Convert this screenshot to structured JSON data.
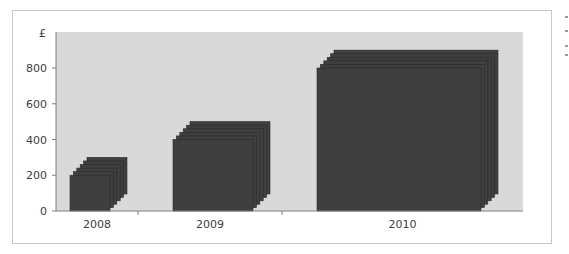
{
  "chart_data": {
    "type": "bar",
    "style": "stacked-depth 3D blocks (front face = lower value, back face = upper value)",
    "title": "",
    "xlabel": "",
    "ylabel": "£",
    "categories": [
      "2008",
      "2009",
      "2010"
    ],
    "series": [
      {
        "name": "front",
        "values": [
          200,
          400,
          800
        ]
      },
      {
        "name": "back",
        "values": [
          300,
          500,
          900
        ]
      }
    ],
    "bar_widths_relative": [
      1,
      2,
      4
    ],
    "yticks": [
      "0",
      "200",
      "400",
      "600",
      "800"
    ],
    "ylim": [
      0,
      1000
    ],
    "grid": false,
    "legend": "none",
    "colors": {
      "bar": "#3f3f3f",
      "bar_edge": "#2a2a2a",
      "plot_bg": "#d9d9d9",
      "frame": "#c8c8c8"
    }
  },
  "axis": {
    "y_unit_label": "£",
    "y_ticks": [
      "0",
      "200",
      "400",
      "600",
      "800"
    ],
    "x_labels": [
      "2008",
      "2009",
      "2010"
    ]
  }
}
